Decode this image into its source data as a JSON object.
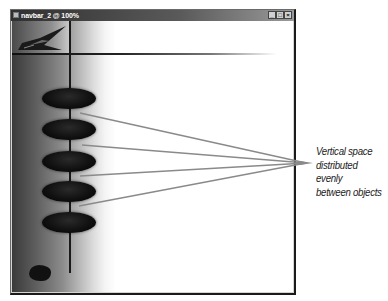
{
  "window": {
    "title": "navbar_2 @ 100%",
    "controls": {
      "minimize": "_",
      "maximize": "□",
      "close": "×"
    }
  },
  "canvas": {
    "logo_icon": "wing-logo-icon",
    "nav_buttons": [
      {
        "name": "nav-oval-1"
      },
      {
        "name": "nav-oval-2"
      },
      {
        "name": "nav-oval-3"
      },
      {
        "name": "nav-oval-4"
      },
      {
        "name": "nav-oval-5"
      }
    ],
    "guides": {
      "vertical": true,
      "horizontal": true
    }
  },
  "annotation": {
    "line1": "Vertical space",
    "line2": "distributed evenly",
    "line3": "between objects",
    "leader_color": "#8a8a8a"
  }
}
